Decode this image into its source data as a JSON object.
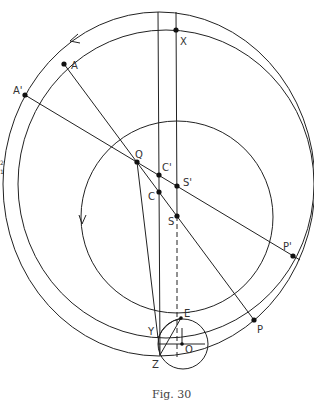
{
  "figure": {
    "caption": "Fig. 30",
    "points": [
      {
        "id": "X",
        "label": "X",
        "x": 176,
        "y": 30,
        "lx": 180,
        "ly": 45
      },
      {
        "id": "A",
        "label": "A",
        "x": 64,
        "y": 64,
        "lx": 71,
        "ly": 69
      },
      {
        "id": "A-prime",
        "label": "A'",
        "x": 25,
        "y": 95,
        "lx": 13,
        "ly": 94
      },
      {
        "id": "Q",
        "label": "Q",
        "x": 137,
        "y": 162,
        "lx": 135,
        "ly": 158
      },
      {
        "id": "C-prime",
        "label": "C'",
        "x": 159,
        "y": 175,
        "lx": 162,
        "ly": 171
      },
      {
        "id": "S-prime",
        "label": "S'",
        "x": 177,
        "y": 186,
        "lx": 183,
        "ly": 186
      },
      {
        "id": "C",
        "label": "C",
        "x": 159,
        "y": 192,
        "lx": 148,
        "ly": 200
      },
      {
        "id": "S",
        "label": "S",
        "x": 177,
        "y": 216,
        "lx": 168,
        "ly": 225
      },
      {
        "id": "P-prime",
        "label": "P'",
        "x": 293,
        "y": 256,
        "lx": 283,
        "ly": 250
      },
      {
        "id": "P",
        "label": "P",
        "x": 254,
        "y": 320,
        "lx": 257,
        "ly": 333
      },
      {
        "id": "E",
        "label": "E",
        "x": 181,
        "y": 318,
        "lx": 184,
        "ly": 317
      },
      {
        "id": "O",
        "label": "O",
        "x": 182,
        "y": 344,
        "lx": 185,
        "ly": 353
      },
      {
        "id": "Y",
        "label": "Y",
        "x": 158,
        "y": 338,
        "lx": 148,
        "ly": 335
      },
      {
        "id": "Z",
        "label": "Z",
        "x": 160,
        "y": 355,
        "lx": 152,
        "ly": 368
      }
    ],
    "side_marks": [
      "2",
      "1"
    ]
  }
}
